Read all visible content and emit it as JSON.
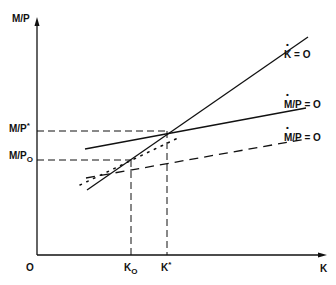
{
  "diagram": {
    "y_axis_label": "M/P",
    "x_axis_label": "K",
    "origin_label": "O",
    "y_ticks": [
      {
        "label": "M/P*",
        "main": "M/P",
        "mark": "*"
      },
      {
        "label": "M/P0",
        "main": "M/P",
        "mark": "O"
      }
    ],
    "x_ticks": [
      {
        "label": "K0",
        "main": "K",
        "mark": "O"
      },
      {
        "label": "K*",
        "main": "K",
        "mark": "*"
      }
    ],
    "curves": [
      {
        "name": "K-dot = 0",
        "main": "K",
        "rest": " = O",
        "style": "solid"
      },
      {
        "name": "(M/P)-dot = 0",
        "main": "M/P",
        "rest": " = O",
        "style": "solid"
      },
      {
        "name": "(M/P)-dot = 0",
        "main": "M/P",
        "rest": " = O",
        "style": "dashed"
      },
      {
        "name": "adjustment path",
        "style": "dotted"
      }
    ]
  }
}
